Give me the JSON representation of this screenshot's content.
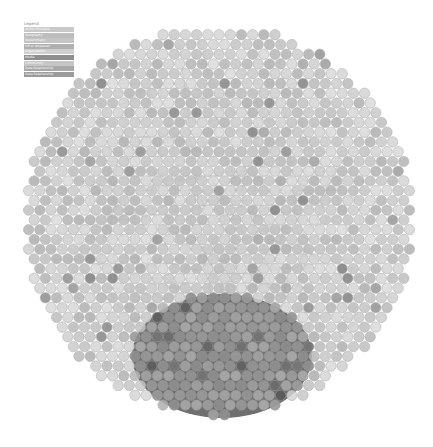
{
  "legend": {
    "title": "Legend",
    "items": [
      {
        "label": "Active Principle",
        "color": "#c9c9c9"
      },
      {
        "label": "Geography",
        "color": "#bdbdbd"
      },
      {
        "label": "Government",
        "color": "#c4c4c4"
      },
      {
        "label": "HR or whatever",
        "color": "#b0b0b0"
      },
      {
        "label": "Organization",
        "color": "#cfcfcf"
      },
      {
        "label": "Media",
        "color": "#8e8e8e"
      },
      {
        "label": "Community",
        "color": "#c6c6c6"
      },
      {
        "label": "Data Relationship",
        "color": "#a8a8a8"
      },
      {
        "label": "Data Relationship",
        "color": "#9a9a9a"
      }
    ]
  },
  "graph": {
    "center": [
      218,
      220
    ],
    "radius": 195,
    "node_radius": 5.2,
    "dense_cluster": {
      "cx": 222,
      "cy": 356,
      "rx": 90,
      "ry": 62
    },
    "node_fill": "#c8c8c8",
    "node_stroke": "#a9a9a9",
    "edge_color": "#8a8a8a",
    "cluster_fill": "#6f6f6f"
  }
}
